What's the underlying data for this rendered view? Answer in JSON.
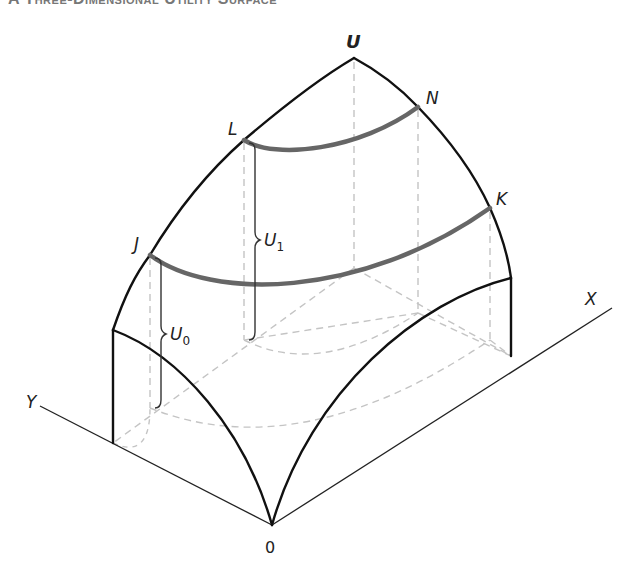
{
  "title": "A Three-Dimensional Utility Surface",
  "figure": {
    "labels": {
      "peak": "U",
      "point_L": "L",
      "point_N": "N",
      "point_J": "J",
      "point_K": "K",
      "axis_x": "X",
      "axis_y": "Y",
      "origin": "0",
      "utility_high": "U",
      "utility_high_sub": "1",
      "utility_low": "U",
      "utility_low_sub": "0"
    },
    "colors": {
      "surface_edge": "#111111",
      "indifference_curve": "#666666",
      "hidden_line": "#bdbdbd",
      "axis": "#222222"
    }
  }
}
